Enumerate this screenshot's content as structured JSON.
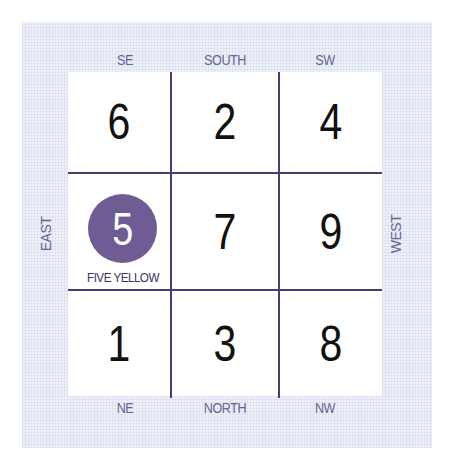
{
  "diagram": {
    "type": "flying-star-lo-shu-grid",
    "directions": {
      "top": [
        "SE",
        "SOUTH",
        "SW"
      ],
      "bottom": [
        "NE",
        "NORTH",
        "NW"
      ],
      "left": "EAST",
      "right": "WEST"
    },
    "grid": [
      [
        "6",
        "2",
        "4"
      ],
      [
        "5",
        "7",
        "9"
      ],
      [
        "1",
        "3",
        "8"
      ]
    ],
    "highlight": {
      "number": "5",
      "label": "FIVE YELLOW",
      "color": "#6f5c94"
    },
    "colors": {
      "line": "#4b3b72",
      "direction_text": "#6a6390",
      "panel_bg": "#eef1f9"
    }
  }
}
